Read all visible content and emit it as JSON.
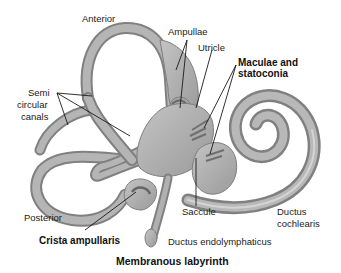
{
  "diagram": {
    "title": "Membranous labyrinth",
    "labels": {
      "anterior": "Anterior",
      "ampullae": "Ampullae",
      "utricle": "Utricle",
      "maculae_line1": "Maculae and",
      "maculae_line2": "statoconia",
      "semi_line1": "Semi",
      "semi_line2": "circular",
      "semi_line3": "canals",
      "posterior": "Posterior",
      "crista": "Crista ampullaris",
      "saccule": "Saccule",
      "ductus_cochlearis_line1": "Ductus",
      "ductus_cochlearis_line2": "cochlearis",
      "ductus_endolymphaticus": "Ductus endolymphaticus"
    },
    "colors": {
      "tube_fill": "#a9a9a9",
      "tube_edge": "#7e7e7e",
      "tube_highlight": "#cfcfcf",
      "macula": "#6f6f6f",
      "leader_line": "#1a1a1a",
      "background": "#ffffff"
    }
  }
}
